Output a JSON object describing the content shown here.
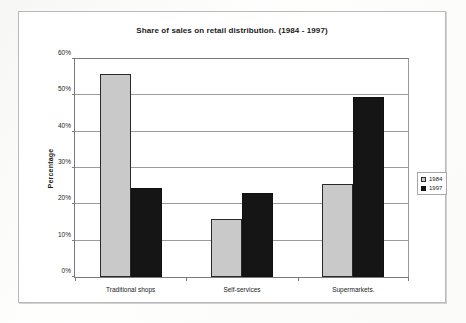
{
  "chart_data": {
    "type": "bar",
    "title": "Share of sales on retail distribution. (1984 - 1997)",
    "xlabel": "",
    "ylabel": "Percentage",
    "categories": [
      "Traditional shops",
      "Self-services",
      "Supermarkets."
    ],
    "series": [
      {
        "name": "1984",
        "color": "#c9c9c9",
        "values": [
          56,
          16,
          25.5
        ]
      },
      {
        "name": "1997",
        "color": "#151515",
        "values": [
          24.5,
          23,
          49.5
        ]
      }
    ],
    "ylim": [
      0,
      60
    ],
    "ytick_labels": [
      "0%",
      "10%",
      "20%",
      "30%",
      "40%",
      "50%",
      "60%"
    ],
    "ytick_values": [
      0,
      10,
      20,
      30,
      40,
      50,
      60
    ],
    "grid": true,
    "legend_position": "right"
  }
}
